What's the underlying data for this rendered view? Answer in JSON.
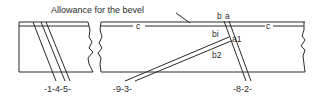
{
  "diagram": {
    "title_annotation": "Allowance for the bevel",
    "labels": {
      "left_group": "-1-4-5-",
      "middle_group": "-9-3-",
      "right_group": "-8-2-",
      "c_left": "c",
      "c_right": "c",
      "b_top": "b",
      "a_top": "a",
      "bi": "bi",
      "a1": "a1",
      "b2": "b2"
    },
    "colors": {
      "line": "#2a2a2a",
      "background": "#ffffff"
    }
  }
}
